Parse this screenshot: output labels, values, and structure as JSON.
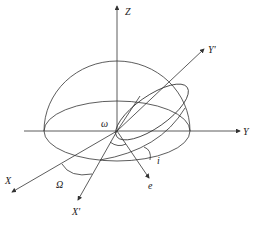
{
  "diagram": {
    "labels": {
      "z_axis": "Z",
      "y_axis": "Y",
      "y_prime_axis": "Y'",
      "x_axis": "X",
      "x_prime_axis": "X'",
      "eccentricity_vector": "e",
      "argument_of_periapsis": "ω",
      "longitude_of_ascending_node": "Ω",
      "inclination": "i"
    },
    "stroke_color": "#333333",
    "background_color": "#ffffff"
  }
}
